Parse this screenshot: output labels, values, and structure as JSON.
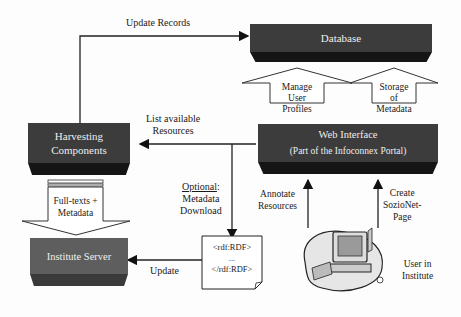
{
  "nodes": {
    "database": {
      "label": "Database",
      "color": "#3a3a3a"
    },
    "harvesting": {
      "line1": "Harvesting",
      "line2": "Components",
      "color": "#3a3a3a"
    },
    "web_interface": {
      "line1": "Web Interface",
      "line2": "(Part of the  Infoconnex Portal)",
      "color": "#3a3a3a"
    },
    "institute_server": {
      "label": "Institute Server",
      "color": "#5c5c5c"
    },
    "rdf_doc": {
      "line1": "<rdf:RDF>",
      "line2": "...",
      "line3": "</rdf:RDF>"
    },
    "user": {
      "line1": "User in",
      "line2": "Institute"
    }
  },
  "edges": {
    "update_records": "Update Records",
    "list_resources": {
      "line1": "List available",
      "line2": "Resources"
    },
    "optional_download": {
      "emph": "Optional",
      "line1": ":",
      "line2": "Metadata",
      "line3": "Download"
    },
    "update": "Update",
    "annotate": {
      "line1": "Annotate",
      "line2": "Resources"
    },
    "create_page": {
      "line1": "Create",
      "line2": "SozioNet-",
      "line3": "Page"
    }
  },
  "block_arrows": {
    "manage_profiles": {
      "line1": "Manage",
      "line2": "User",
      "line3": "Profiles"
    },
    "storage_metadata": {
      "line1": "Storage",
      "line2": "of",
      "line3": "Metadata"
    },
    "fulltexts": {
      "line1": "Full-texts +",
      "line2": "Metadata"
    }
  }
}
